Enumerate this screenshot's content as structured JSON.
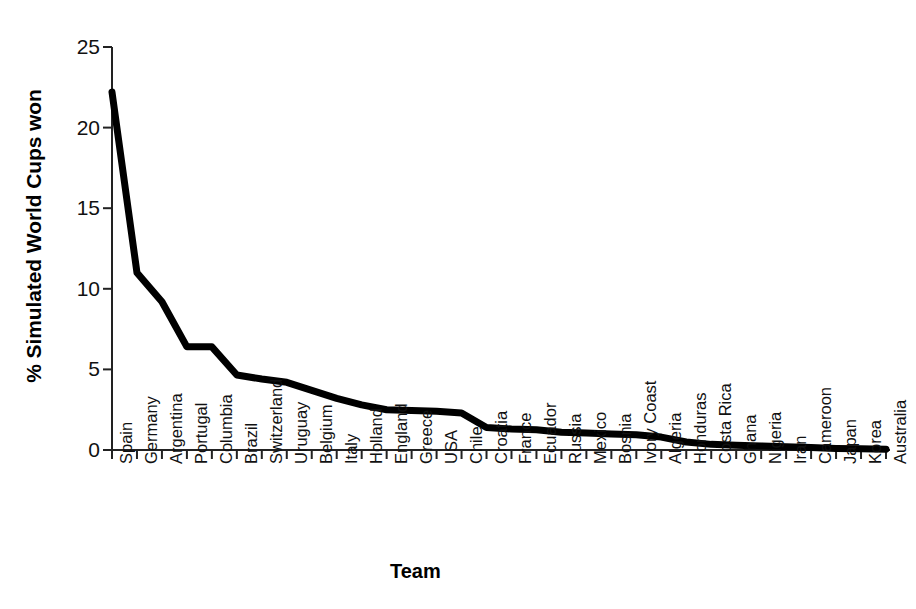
{
  "chart_data": {
    "type": "line",
    "title": "",
    "xlabel": "Team",
    "ylabel": "% Simulated World Cups won",
    "ylim": [
      0,
      25
    ],
    "yticks": [
      0,
      5,
      10,
      15,
      20,
      25
    ],
    "ytick_labels": [
      "0",
      "5",
      "10",
      "15",
      "20",
      "25"
    ],
    "grid": false,
    "legend": "none",
    "line_color": "#000000",
    "line_width": 7,
    "categories": [
      "Spain",
      "Germany",
      "Argentina",
      "Portugal",
      "Columbia",
      "Brazil",
      "Switzerland",
      "Uruguay",
      "Belgium",
      "Italy",
      "Holland",
      "England",
      "Greece",
      "USA",
      "Chile",
      "Croatia",
      "France",
      "Ecuador",
      "Russia",
      "Mexico",
      "Bosnia",
      "Ivory Coast",
      "Algeria",
      "Honduras",
      "Costa Rica",
      "Ghana",
      "Nigeria",
      "Iran",
      "Cameroon",
      "Japan",
      "Korea",
      "Australia"
    ],
    "values": [
      22.2,
      11.0,
      9.2,
      6.4,
      6.4,
      4.65,
      4.4,
      4.2,
      3.7,
      3.2,
      2.8,
      2.5,
      2.45,
      2.4,
      2.3,
      1.4,
      1.3,
      1.25,
      1.1,
      1.05,
      1.0,
      0.95,
      0.8,
      0.5,
      0.35,
      0.3,
      0.25,
      0.2,
      0.15,
      0.1,
      0.08,
      0.05
    ]
  }
}
